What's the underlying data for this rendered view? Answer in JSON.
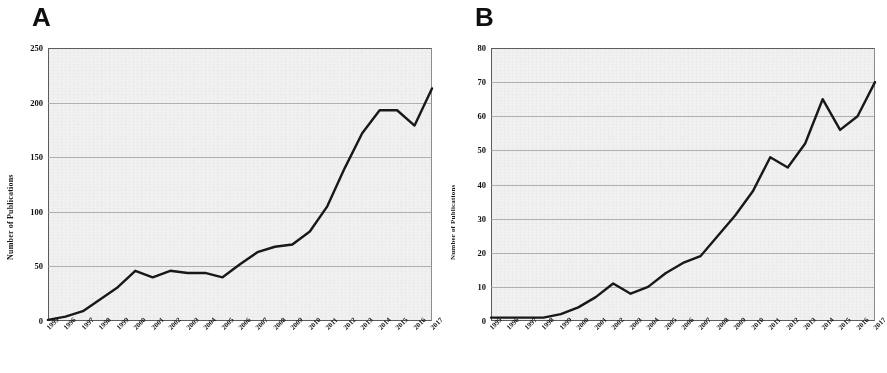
{
  "figure": {
    "background_color": "#ffffff",
    "plot_background_color": "#efefef",
    "line_color": "#1a1a1a",
    "grid_color": "#9a9a9a"
  },
  "panels": [
    {
      "label": "A",
      "y_axis_title": "Number of Publications"
    },
    {
      "label": "B",
      "y_axis_title": "Number of Publications"
    }
  ],
  "chart_data": [
    {
      "type": "line",
      "title": "A",
      "xlabel": "",
      "ylabel": "Number of Publications",
      "ylim": [
        0,
        250
      ],
      "yticks": [
        0,
        50,
        100,
        150,
        200,
        250
      ],
      "grid": true,
      "legend": "none",
      "x": [
        "1995",
        "1996",
        "1997",
        "1998",
        "1999",
        "2000",
        "2001",
        "2002",
        "2003",
        "2004",
        "2005",
        "2006",
        "2007",
        "2008",
        "2009",
        "2010",
        "2011",
        "2012",
        "2013",
        "2014",
        "2015",
        "2016",
        "2017"
      ],
      "values": [
        1,
        4,
        9,
        20,
        31,
        46,
        40,
        46,
        44,
        44,
        40,
        52,
        63,
        68,
        70,
        82,
        105,
        140,
        172,
        193,
        193,
        179,
        213
      ]
    },
    {
      "type": "line",
      "title": "B",
      "xlabel": "",
      "ylabel": "Number of Publications",
      "ylim": [
        0,
        80
      ],
      "yticks": [
        0,
        10,
        20,
        30,
        40,
        50,
        60,
        70,
        80
      ],
      "grid": true,
      "legend": "none",
      "x": [
        "1995",
        "1996",
        "1997",
        "1998",
        "1999",
        "2000",
        "2001",
        "2002",
        "2003",
        "2004",
        "2005",
        "2006",
        "2007",
        "2008",
        "2009",
        "2010",
        "2011",
        "2012",
        "2013",
        "2014",
        "2015",
        "2016",
        "2017"
      ],
      "values": [
        1,
        1,
        1,
        1,
        2,
        4,
        7,
        11,
        8,
        10,
        14,
        17,
        19,
        25,
        31,
        38,
        48,
        45,
        52,
        65,
        56,
        60,
        70
      ]
    }
  ]
}
